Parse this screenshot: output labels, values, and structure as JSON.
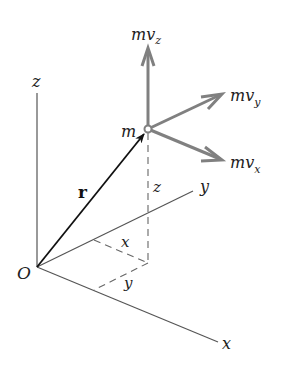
{
  "diagram": {
    "title": "",
    "origin_label": "O",
    "axes": {
      "z": {
        "label": "z"
      },
      "y": {
        "label": "y"
      },
      "x": {
        "label": "x"
      }
    },
    "position_vector": {
      "label": "r"
    },
    "particle": {
      "label": "m"
    },
    "components": {
      "z_label": "z",
      "x_label": "x",
      "y_label": "y"
    },
    "momentum": {
      "vz": {
        "main": "mv",
        "sub": "z"
      },
      "vy": {
        "main": "mv",
        "sub": "y"
      },
      "vx": {
        "main": "mv",
        "sub": "x"
      }
    },
    "colors": {
      "axis": "#555555",
      "position_vector": "#111111",
      "momentum_vector": "#808080",
      "dashed": "#666666",
      "text": "#222222"
    }
  }
}
